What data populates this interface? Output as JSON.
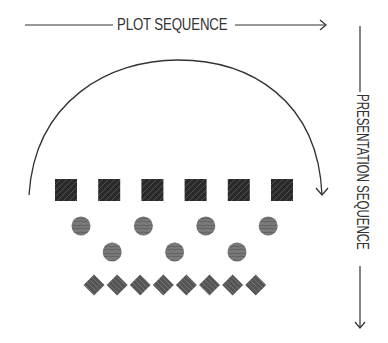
{
  "diagram": {
    "horizontal_axis": {
      "label": "PLOT SEQUENCE",
      "direction": "right"
    },
    "vertical_axis": {
      "label": "PRESENTATION SEQUENCE",
      "direction": "down"
    },
    "arc": {
      "from": "left",
      "to": "right",
      "meaning": "plot order loops back"
    },
    "rows": [
      {
        "name": "squares",
        "shape": "square",
        "count": 6,
        "color": "#2e2e2e"
      },
      {
        "name": "circles",
        "shape": "circle",
        "count": 7,
        "color": "#7a7a7a",
        "arrangement": "zigzag",
        "top_row": 4,
        "bottom_row": 3
      },
      {
        "name": "diamonds",
        "shape": "diamond",
        "count": 8,
        "color": "#5c5c5c"
      }
    ],
    "colors": {
      "line": "#333333",
      "text": "#333333"
    }
  }
}
